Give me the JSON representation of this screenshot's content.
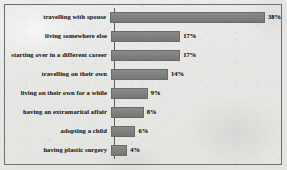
{
  "chart_data": {
    "type": "bar",
    "orientation": "horizontal",
    "title": "",
    "xlabel": "",
    "ylabel": "",
    "grid": false,
    "legend": null,
    "xlim": [
      0,
      40
    ],
    "value_suffix": "%",
    "categories": [
      "travelling with spouse",
      "living somewhere else",
      "starting over in a different career",
      "travelling on their own",
      "living on their own for a while",
      "having an extramarital affair",
      "adopting a child",
      "having plastic surgery"
    ],
    "values": [
      38,
      17,
      17,
      14,
      9,
      8,
      6,
      4
    ],
    "value_labels": [
      "38%",
      "17%",
      "17%",
      "14%",
      "9%",
      "8%",
      "6%",
      "4%"
    ],
    "bars": [
      {
        "label": "travelling with spouse",
        "value": 38,
        "value_label": "38%"
      },
      {
        "label": "living somewhere else",
        "value": 17,
        "value_label": "17%"
      },
      {
        "label": "starting over in a different career",
        "value": 17,
        "value_label": "17%"
      },
      {
        "label": "travelling on their own",
        "value": 14,
        "value_label": "14%"
      },
      {
        "label": "living on their own for a while",
        "value": 9,
        "value_label": "9%"
      },
      {
        "label": "having an extramarital affair",
        "value": 8,
        "value_label": "8%"
      },
      {
        "label": "adopting a child",
        "value": 6,
        "value_label": "6%"
      },
      {
        "label": "having plastic surgery",
        "value": 4,
        "value_label": "4%"
      }
    ]
  },
  "style": {
    "background_color": "#e9e9e7",
    "bar_color": "#7d7d7b",
    "bar_border_color": "#6a6a68",
    "axis_color": "#5c5c5a",
    "frame_color": "#6f6f6d",
    "text_color": "#2f2f2e"
  }
}
